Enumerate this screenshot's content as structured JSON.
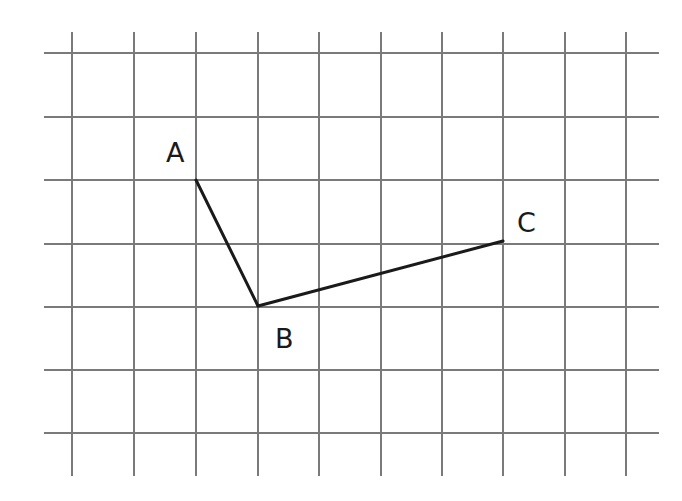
{
  "diagram": {
    "type": "grid-with-points",
    "grid": {
      "columns_x": [
        72,
        134,
        196,
        258,
        319,
        381,
        442,
        503,
        565,
        626
      ],
      "rows_y": [
        53,
        117,
        180,
        244,
        307,
        370,
        433
      ],
      "h_line_start_x": 44,
      "h_line_end_x": 659,
      "v_line_start_y": 32,
      "v_line_end_y": 476,
      "line_color": "#7a7a7a"
    },
    "points": [
      {
        "id": "A",
        "label": "A",
        "x": 196,
        "y": 180,
        "label_x": 166,
        "label_y": 162
      },
      {
        "id": "B",
        "label": "B",
        "x": 258,
        "y": 306,
        "label_x": 275,
        "label_y": 348
      },
      {
        "id": "C",
        "label": "C",
        "x": 503,
        "y": 241,
        "label_x": 517,
        "label_y": 232
      }
    ],
    "segments": [
      {
        "from": "A",
        "to": "B"
      },
      {
        "from": "B",
        "to": "C"
      }
    ],
    "segment_color": "#1a1a1a"
  }
}
